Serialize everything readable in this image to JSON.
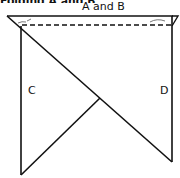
{
  "diagram": {
    "top_cut_text": "Folding A and B",
    "labels": {
      "top": "A and B",
      "left": "C",
      "right": "D"
    },
    "colors": {
      "stroke": "#111111",
      "background": "#ffffff"
    },
    "shapes": {
      "top_edge": {
        "x1": 7,
        "y1": 16,
        "x2": 173,
        "y2": 16
      },
      "fold_line_dashed": {
        "x1": 22,
        "y1": 25,
        "x2": 172,
        "y2": 25
      },
      "main_diagonal": {
        "x1": 7,
        "y1": 16,
        "x2": 172,
        "y2": 162
      },
      "left_vertical": {
        "x1": 21,
        "y1": 26,
        "x2": 21,
        "y2": 175
      },
      "left_lower_edge": {
        "x1": 21,
        "y1": 175,
        "x2": 100,
        "y2": 98
      },
      "right_vertical": {
        "x1": 172,
        "y1": 16,
        "x2": 172,
        "y2": 162
      },
      "right_flap": {
        "points": "172,16 178,16 172,26"
      }
    }
  }
}
